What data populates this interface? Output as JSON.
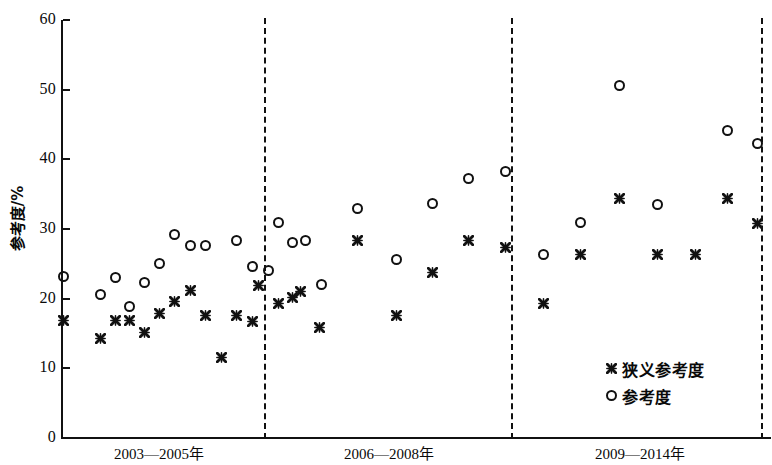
{
  "chart_data": {
    "type": "scatter",
    "title": "",
    "xlabel": "",
    "ylabel": "参考度/%",
    "ylim": [
      0,
      60
    ],
    "yticks": [
      0,
      10,
      20,
      30,
      40,
      50,
      60
    ],
    "grid": false,
    "legend_position": "bottom-right",
    "x_group_labels": [
      "2003—2005年",
      "2006—2008年",
      "2009—2014年"
    ],
    "group_boundaries_x": [
      264,
      511,
      761
    ],
    "series": [
      {
        "name": "狭义参考度",
        "marker": "cross",
        "points": [
          {
            "x": 63,
            "y": 16.8
          },
          {
            "x": 100,
            "y": 14.3
          },
          {
            "x": 115,
            "y": 16.9
          },
          {
            "x": 129,
            "y": 16.9
          },
          {
            "x": 144,
            "y": 15.2
          },
          {
            "x": 159,
            "y": 17.9
          },
          {
            "x": 174,
            "y": 19.6
          },
          {
            "x": 190,
            "y": 21.2
          },
          {
            "x": 205,
            "y": 17.6
          },
          {
            "x": 221,
            "y": 11.5
          },
          {
            "x": 236,
            "y": 17.6
          },
          {
            "x": 252,
            "y": 16.7
          },
          {
            "x": 258,
            "y": 21.9
          },
          {
            "x": 278,
            "y": 19.3
          },
          {
            "x": 292,
            "y": 20.2
          },
          {
            "x": 300,
            "y": 21.0
          },
          {
            "x": 319,
            "y": 15.8
          },
          {
            "x": 357,
            "y": 28.4
          },
          {
            "x": 396,
            "y": 17.6
          },
          {
            "x": 432,
            "y": 23.8
          },
          {
            "x": 468,
            "y": 28.4
          },
          {
            "x": 505,
            "y": 27.4
          },
          {
            "x": 543,
            "y": 19.3
          },
          {
            "x": 580,
            "y": 26.3
          },
          {
            "x": 619,
            "y": 34.4
          },
          {
            "x": 657,
            "y": 26.3
          },
          {
            "x": 695,
            "y": 26.3
          },
          {
            "x": 727,
            "y": 34.4
          },
          {
            "x": 757,
            "y": 30.8
          }
        ]
      },
      {
        "name": "参考度",
        "marker": "circle",
        "points": [
          {
            "x": 63,
            "y": 23.2
          },
          {
            "x": 100,
            "y": 20.6
          },
          {
            "x": 115,
            "y": 23.0
          },
          {
            "x": 129,
            "y": 18.9
          },
          {
            "x": 144,
            "y": 22.3
          },
          {
            "x": 159,
            "y": 25.1
          },
          {
            "x": 174,
            "y": 29.2
          },
          {
            "x": 190,
            "y": 27.6
          },
          {
            "x": 205,
            "y": 27.6
          },
          {
            "x": 236,
            "y": 28.4
          },
          {
            "x": 252,
            "y": 24.6
          },
          {
            "x": 268,
            "y": 24.0
          },
          {
            "x": 278,
            "y": 31.0
          },
          {
            "x": 292,
            "y": 28.0
          },
          {
            "x": 305,
            "y": 28.4
          },
          {
            "x": 321,
            "y": 22.1
          },
          {
            "x": 357,
            "y": 32.9
          },
          {
            "x": 396,
            "y": 25.6
          },
          {
            "x": 432,
            "y": 33.7
          },
          {
            "x": 468,
            "y": 37.3
          },
          {
            "x": 505,
            "y": 38.2
          },
          {
            "x": 543,
            "y": 26.4
          },
          {
            "x": 580,
            "y": 30.9
          },
          {
            "x": 619,
            "y": 50.6
          },
          {
            "x": 657,
            "y": 33.5
          },
          {
            "x": 727,
            "y": 44.2
          },
          {
            "x": 757,
            "y": 42.3
          }
        ]
      }
    ]
  },
  "axis": {
    "y_title": "参考度/%",
    "y_tick_labels": [
      "0",
      "10",
      "20",
      "30",
      "40",
      "50",
      "60"
    ]
  },
  "legend": {
    "items": [
      {
        "label": "狭义参考度",
        "marker": "cross"
      },
      {
        "label": "参考度",
        "marker": "circle"
      }
    ]
  },
  "periods": [
    {
      "label": "2003—2005年",
      "center_x": 159
    },
    {
      "label": "2006—2008年",
      "center_x": 389
    },
    {
      "label": "2009—2014年",
      "center_x": 640
    }
  ],
  "colors": {
    "ink": "#111111",
    "background": "#ffffff"
  }
}
